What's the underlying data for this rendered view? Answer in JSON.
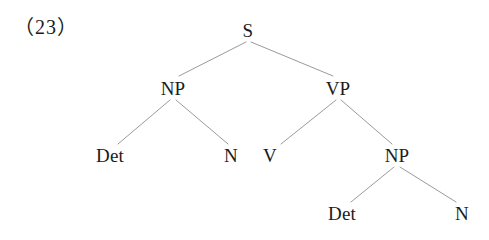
{
  "figure": {
    "example_number": "（23）",
    "background_color": "#ffffff",
    "text_color": "#1b1b1b",
    "line_color": "#9a9a9a"
  },
  "tree": {
    "nodes": [
      {
        "id": "s",
        "label": "S",
        "x": 248,
        "y": 30
      },
      {
        "id": "np1",
        "label": "NP",
        "x": 173,
        "y": 88
      },
      {
        "id": "vp",
        "label": "VP",
        "x": 338,
        "y": 88
      },
      {
        "id": "det1",
        "label": "Det",
        "x": 110,
        "y": 155
      },
      {
        "id": "n1",
        "label": "N",
        "x": 231,
        "y": 155
      },
      {
        "id": "v",
        "label": "V",
        "x": 270,
        "y": 155
      },
      {
        "id": "np2",
        "label": "NP",
        "x": 397,
        "y": 155
      },
      {
        "id": "det2",
        "label": "Det",
        "x": 342,
        "y": 213
      },
      {
        "id": "n2",
        "label": "N",
        "x": 462,
        "y": 213
      }
    ],
    "edges": [
      {
        "from": "s",
        "to": "np1",
        "x1": 246,
        "y1": 42,
        "x2": 179,
        "y2": 76
      },
      {
        "from": "s",
        "to": "vp",
        "x1": 251,
        "y1": 42,
        "x2": 333,
        "y2": 76
      },
      {
        "from": "np1",
        "to": "det1",
        "x1": 170,
        "y1": 100,
        "x2": 118,
        "y2": 144
      },
      {
        "from": "np1",
        "to": "n1",
        "x1": 176,
        "y1": 100,
        "x2": 228,
        "y2": 144
      },
      {
        "from": "vp",
        "to": "v",
        "x1": 336,
        "y1": 100,
        "x2": 281,
        "y2": 144
      },
      {
        "from": "vp",
        "to": "np2",
        "x1": 341,
        "y1": 100,
        "x2": 392,
        "y2": 144
      },
      {
        "from": "np2",
        "to": "det2",
        "x1": 394,
        "y1": 167,
        "x2": 351,
        "y2": 202
      },
      {
        "from": "np2",
        "to": "n2",
        "x1": 400,
        "y1": 167,
        "x2": 456,
        "y2": 202
      }
    ]
  }
}
